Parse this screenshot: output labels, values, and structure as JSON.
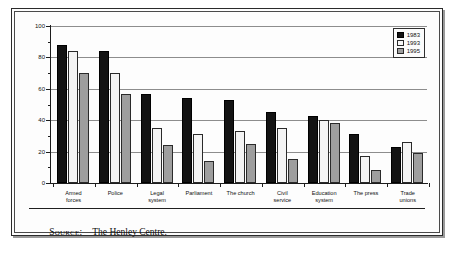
{
  "figure": {
    "source_label": "Source:",
    "source_value": "The Henley Centre."
  },
  "legend": {
    "position": "top-right",
    "entries": [
      {
        "label": "1983",
        "color": "#131313",
        "name": "legend-1983"
      },
      {
        "label": "1993",
        "color": "#f7f7f7",
        "name": "legend-1993"
      },
      {
        "label": "1995",
        "color": "#9e9e9e",
        "name": "legend-1995"
      }
    ]
  },
  "chart_data": {
    "type": "bar",
    "title": "",
    "subtitle": "",
    "xlabel": "",
    "ylabel": "",
    "ylim": [
      0,
      100
    ],
    "yticks": [
      0,
      20,
      40,
      60,
      80,
      100
    ],
    "ytick_labels": [
      "0",
      "20",
      "40",
      "60",
      "80",
      "100"
    ],
    "yminor_step": 10,
    "grid": true,
    "grid_axis": "y",
    "legend_position": "top-right",
    "categories": [
      "Armed\nforces",
      "Police",
      "Legal\nsystem",
      "Parliament",
      "The church",
      "Civil\nservice",
      "Education\nsystem",
      "The press",
      "Trade\nunions"
    ],
    "series": [
      {
        "name": "1983",
        "color": "#131313",
        "values": [
          88,
          84,
          57,
          54,
          53,
          45,
          43,
          31,
          23
        ]
      },
      {
        "name": "1993",
        "color": "#f7f7f7",
        "values": [
          84,
          70,
          35,
          31,
          33,
          35,
          40,
          17,
          26
        ]
      },
      {
        "name": "1995",
        "color": "#9e9e9e",
        "values": [
          70,
          57,
          24,
          14,
          25,
          15,
          38,
          8,
          19
        ]
      }
    ]
  }
}
